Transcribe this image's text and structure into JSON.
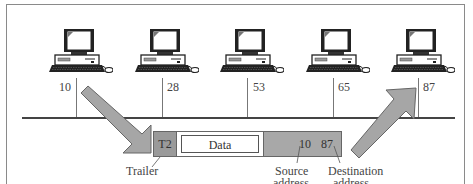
{
  "figure": {
    "type": "bus network frame transmission",
    "computers": [
      {
        "id": 1,
        "address": "10",
        "role": "sender"
      },
      {
        "id": 2,
        "address": "28"
      },
      {
        "id": 3,
        "address": "53"
      },
      {
        "id": 4,
        "address": "65"
      },
      {
        "id": 5,
        "address": "87",
        "role": "receiver"
      }
    ],
    "frame": {
      "trailer": "T2",
      "data": "Data",
      "source_address": "10",
      "destination_address": "87"
    },
    "annotations": {
      "trailer": "Trailer",
      "source_line1": "Source",
      "source_line2": "address",
      "destination_line1": "Destination",
      "destination_line2": "address"
    },
    "colors": {
      "arrow_fill": "#a6a6a6",
      "arrow_stroke": "#666666",
      "trailer_fill": "#9a9a9a",
      "header_fill": "#a8a8a8",
      "bus_line": "#444444"
    }
  }
}
